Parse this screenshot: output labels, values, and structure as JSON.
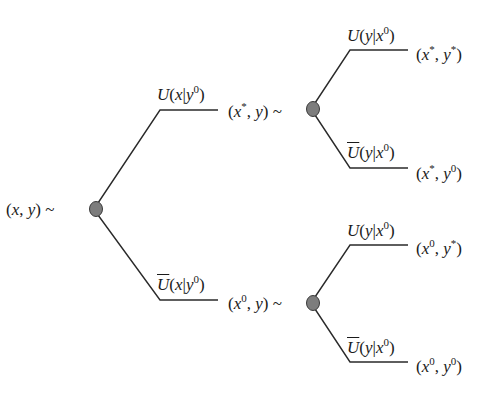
{
  "diagram": {
    "type": "decision-tree",
    "colors": {
      "line": "#2a2a2a",
      "node_fill": "#7d7d7d",
      "node_stroke": "#3a3a3a",
      "text": "#1a1a1a"
    },
    "root": {
      "label": "(x, y) ~"
    },
    "level1": [
      {
        "branch": "U(x|y0)",
        "state": "(x*, y) ~"
      },
      {
        "branch": "Ū(x|y0)",
        "state": "(x0, y) ~"
      }
    ],
    "level2": [
      {
        "parent": "(x*, y)",
        "branch": "U(y|x0)",
        "outcome": "(x*, y*)"
      },
      {
        "parent": "(x*, y)",
        "branch": "Ū(y|x0)",
        "outcome": "(x*, y0)"
      },
      {
        "parent": "(x0, y)",
        "branch": "U(y|x0)",
        "outcome": "(x0, y*)"
      },
      {
        "parent": "(x0, y)",
        "branch": "Ū(y|x0)",
        "outcome": "(x0, y0)"
      }
    ]
  },
  "text": {
    "root_x": "x",
    "root_y": "y",
    "tilde": "~",
    "U": "U",
    "Ubar": "U",
    "x": "x",
    "y": "y",
    "zero": "0",
    "star": "*"
  }
}
